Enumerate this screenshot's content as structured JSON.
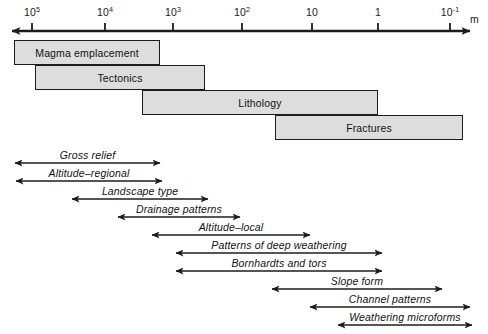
{
  "figure": {
    "kind": "scale-range-diagram",
    "background_color": "#ffffff",
    "line_color": "#1c1c1c",
    "box_fill_color": "#dddddd"
  },
  "axis": {
    "name": "spatial-scale-axis",
    "unit_label": "m",
    "double_headed": true,
    "x_start_px": 12,
    "x_end_px": 470,
    "y_px": 31,
    "ticks": [
      {
        "label_base": "10",
        "label_exponent": "5",
        "x_px": 32
      },
      {
        "label_base": "10",
        "label_exponent": "4",
        "x_px": 105
      },
      {
        "label_base": "10",
        "label_exponent": "3",
        "x_px": 173
      },
      {
        "label_base": "10",
        "label_exponent": "2",
        "x_px": 242
      },
      {
        "label_base": "10",
        "label_exponent": "",
        "x_px": 312
      },
      {
        "label_base": "1",
        "label_exponent": "",
        "x_px": 378
      },
      {
        "label_base": "10",
        "label_exponent": "-1",
        "x_px": 450
      }
    ],
    "unit_x_px": 470,
    "unit_y_px": 13
  },
  "control_boxes": [
    {
      "label": "Magma emplacement",
      "x_px": 14,
      "y_px": 40,
      "width_px": 146,
      "height_px": 25
    },
    {
      "label": "Tectonics",
      "x_px": 35,
      "y_px": 65,
      "width_px": 170,
      "height_px": 25
    },
    {
      "label": "Lithology",
      "x_px": 142,
      "y_px": 90,
      "width_px": 236,
      "height_px": 25
    },
    {
      "label": "Fractures",
      "x_px": 275,
      "y_px": 115,
      "width_px": 188,
      "height_px": 25
    }
  ],
  "span_arrows": [
    {
      "label": "Gross relief",
      "x_start_px": 15,
      "x_end_px": 160,
      "y_px": 163
    },
    {
      "label": "Altitude–regional",
      "x_start_px": 16,
      "x_end_px": 162,
      "y_px": 181
    },
    {
      "label": "Landscape type",
      "x_start_px": 72,
      "x_end_px": 208,
      "y_px": 199
    },
    {
      "label": "Drainage patterns",
      "x_start_px": 118,
      "x_end_px": 240,
      "y_px": 217
    },
    {
      "label": "Altitude–local",
      "x_start_px": 152,
      "x_end_px": 310,
      "y_px": 235
    },
    {
      "label": "Patterns of deep weathering",
      "x_start_px": 176,
      "x_end_px": 382,
      "y_px": 253
    },
    {
      "label": "Bornhardts and tors",
      "x_start_px": 176,
      "x_end_px": 382,
      "y_px": 271
    },
    {
      "label": "Slope form",
      "x_start_px": 272,
      "x_end_px": 442,
      "y_px": 289
    },
    {
      "label": "Channel patterns",
      "x_start_px": 310,
      "x_end_px": 470,
      "y_px": 307
    },
    {
      "label": "Weathering microforms",
      "x_start_px": 338,
      "x_end_px": 472,
      "y_px": 325
    }
  ]
}
